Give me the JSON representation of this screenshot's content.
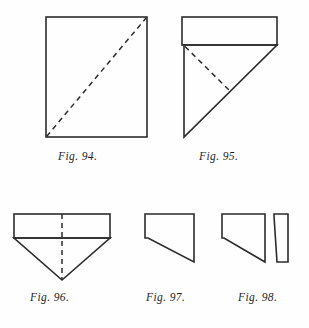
{
  "plate": {
    "background_color": "#fefefe",
    "ink_color": "#2b2b2b",
    "width": 309,
    "height": 328
  },
  "figures": [
    {
      "id": "fig-94",
      "caption": "Fig. 94.",
      "description": "Upright rectangle (sheet of paper) with a dashed diagonal fold line from the bottom-left corner to the top-right corner.",
      "solid_outline": [
        [
          46,
          17
        ],
        [
          147,
          17
        ],
        [
          147,
          137
        ],
        [
          46,
          137
        ]
      ],
      "dashed_lines": [
        [
          [
            46,
            137
          ],
          [
            147,
            17
          ]
        ]
      ]
    },
    {
      "id": "fig-95",
      "caption": "Fig. 95.",
      "description": "Narrow horizontal rectangle on top; beneath it a right triangle with vertical left side, hypotenuse rising to the right; a dashed fold line runs from the triangle's top-left corner down to a point on the hypotenuse.",
      "solid_outline": [
        [
          182,
          17
        ],
        [
          277,
          17
        ],
        [
          277,
          45
        ],
        [
          277,
          45
        ],
        [
          229,
          93
        ],
        [
          184,
          137
        ],
        [
          184,
          45
        ],
        [
          182,
          45
        ]
      ],
      "rect_top": [
        [
          182,
          17
        ],
        [
          277,
          17
        ],
        [
          277,
          45
        ],
        [
          182,
          45
        ]
      ],
      "triangle": [
        [
          184,
          45
        ],
        [
          277,
          45
        ],
        [
          184,
          137
        ]
      ],
      "dashed_lines": [
        [
          [
            184,
            45
          ],
          [
            229,
            93
          ]
        ]
      ]
    },
    {
      "id": "fig-96",
      "caption": "Fig. 96.",
      "description": "Horizontal rectangle on top, with a downward-pointing triangle below it; a dashed vertical centre fold line runs from the top edge to the bottom apex.",
      "rect_top": [
        [
          14,
          214
        ],
        [
          110,
          214
        ],
        [
          110,
          238
        ],
        [
          14,
          238
        ]
      ],
      "triangle": [
        [
          14,
          238
        ],
        [
          110,
          238
        ],
        [
          62,
          280
        ]
      ],
      "dashed_lines": [
        [
          [
            62,
            214
          ],
          [
            62,
            280
          ]
        ]
      ]
    },
    {
      "id": "fig-97",
      "caption": "Fig. 97.",
      "description": "Right trapezoid: horizontal top edge, vertical right edge, diagonal lower edge rising from the bottom-right to the left, short vertical left edge.",
      "solid_outline": [
        [
          145,
          214
        ],
        [
          194,
          214
        ],
        [
          194,
          262
        ],
        [
          148,
          238
        ],
        [
          145,
          238
        ]
      ]
    },
    {
      "id": "fig-98",
      "caption": "Fig. 98.",
      "description": "The same trapezoid as Fig. 97 but slightly narrower, with a thin slanted strip cut away and standing beside it on the right.",
      "main_shape": [
        [
          222,
          214
        ],
        [
          265,
          214
        ],
        [
          265,
          262
        ],
        [
          224,
          238
        ],
        [
          222,
          238
        ]
      ],
      "strip_shape": [
        [
          274,
          214
        ],
        [
          288,
          214
        ],
        [
          288,
          262
        ],
        [
          277,
          262
        ],
        [
          274,
          216
        ]
      ]
    }
  ],
  "captions": {
    "fig94": "Fig. 94.",
    "fig95": "Fig. 95.",
    "fig96": "Fig. 96.",
    "fig97": "Fig. 97.",
    "fig98": "Fig. 98."
  }
}
